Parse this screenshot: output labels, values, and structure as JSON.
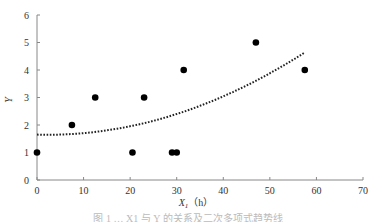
{
  "chart_data": {
    "type": "scatter",
    "title": "",
    "xlabel": "X",
    "xlabel_sub": "1",
    "xlabel_unit": "（h）",
    "ylabel": "Y",
    "xlim": [
      0,
      70
    ],
    "ylim": [
      0,
      6
    ],
    "x_ticks": [
      0,
      10,
      20,
      30,
      40,
      50,
      60,
      70
    ],
    "y_ticks": [
      0,
      1,
      2,
      3,
      4,
      5,
      6
    ],
    "grid": false,
    "legend": "none",
    "series": [
      {
        "name": "observations",
        "type": "scatter",
        "points": [
          {
            "x": 0,
            "y": 1
          },
          {
            "x": 7.5,
            "y": 2
          },
          {
            "x": 12.5,
            "y": 3
          },
          {
            "x": 20.5,
            "y": 1
          },
          {
            "x": 23,
            "y": 3
          },
          {
            "x": 29,
            "y": 1
          },
          {
            "x": 30,
            "y": 1
          },
          {
            "x": 31.5,
            "y": 4
          },
          {
            "x": 47,
            "y": 5
          },
          {
            "x": 57.5,
            "y": 4
          }
        ]
      },
      {
        "name": "trend",
        "type": "line",
        "style": "dotted",
        "x_range": [
          0,
          57.5
        ],
        "poly": {
          "a": 0.00098,
          "b": -0.0044,
          "c": 1.65
        }
      }
    ]
  },
  "colors": {
    "axis": "#888888",
    "point": "#000000",
    "trend": "#222222"
  },
  "caption": "图 1 … X1 与 Y 的关系及二次多项式趋势线"
}
